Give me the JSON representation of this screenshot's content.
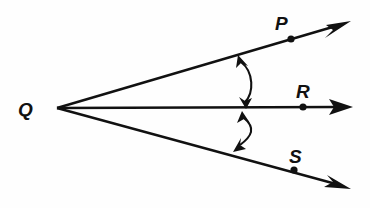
{
  "figure": {
    "type": "geometry-diagram",
    "width": 370,
    "height": 208,
    "background_color": "#fefefe",
    "stroke_color": "#111111"
  },
  "vertex": {
    "label": "Q",
    "name": "vertex-q",
    "x": 57,
    "y": 108,
    "label_x": 18,
    "label_y": 116
  },
  "points": [
    {
      "label": "P",
      "name": "point-p",
      "x": 291,
      "y": 39,
      "label_x": 275,
      "label_y": 30
    },
    {
      "label": "R",
      "name": "point-r",
      "x": 303,
      "y": 107,
      "label_x": 296,
      "label_y": 98
    },
    {
      "label": "S",
      "name": "point-s",
      "x": 294,
      "y": 170,
      "label_x": 289,
      "label_y": 163
    }
  ],
  "rays": [
    {
      "name": "ray-qp",
      "from": "Q",
      "through": "P",
      "start_x": 57,
      "start_y": 108,
      "end_x": 350,
      "end_y": 22
    },
    {
      "name": "ray-qr",
      "from": "Q",
      "through": "R",
      "start_x": 57,
      "start_y": 108,
      "end_x": 352,
      "end_y": 107
    },
    {
      "name": "ray-qs",
      "from": "Q",
      "through": "S",
      "start_x": 57,
      "start_y": 108,
      "end_x": 350,
      "end_y": 188
    }
  ],
  "angle_arcs": [
    {
      "name": "angle-arc-pqr",
      "between": "ray-qp and ray-qr",
      "start_x": 240,
      "start_y": 57,
      "end_x": 244,
      "end_y": 106,
      "bulge_x": 258,
      "bulge_y": 82,
      "double_headed": true
    },
    {
      "name": "angle-arc-rqs",
      "between": "ray-qr and ray-qs",
      "start_x": 244,
      "start_y": 113,
      "end_x": 236,
      "end_y": 149,
      "bulge_x": 258,
      "bulge_y": 133,
      "double_headed": true
    }
  ]
}
